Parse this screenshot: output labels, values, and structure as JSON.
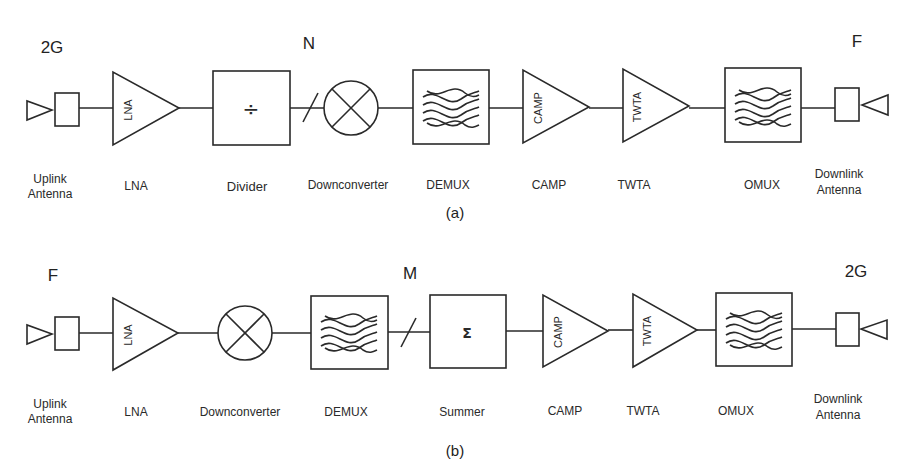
{
  "diagram_a": {
    "caption": "(a)",
    "markers": {
      "left": "2G",
      "middle": "N",
      "right": "F"
    },
    "labels": {
      "uplink_line1": "Uplink",
      "uplink_line2": "Antenna",
      "lna": "LNA",
      "divider": "Divider",
      "downconverter": "Downconverter",
      "demux": "DEMUX",
      "camp": "CAMP",
      "twta": "TWTA",
      "omux": "OMUX",
      "downlink_line1": "Downlink",
      "downlink_line2": "Antenna"
    },
    "inner": {
      "lna": "LNA",
      "divider": "÷",
      "camp": "CAMP",
      "twta": "TWTA"
    }
  },
  "diagram_b": {
    "caption": "(b)",
    "markers": {
      "left": "F",
      "middle": "M",
      "right": "2G"
    },
    "labels": {
      "uplink_line1": "Uplink",
      "uplink_line2": "Antenna",
      "lna": "LNA",
      "downconverter": "Downconverter",
      "demux": "DEMUX",
      "summer": "Summer",
      "camp": "CAMP",
      "twta": "TWTA",
      "omux": "OMUX",
      "downlink_line1": "Downlink",
      "downlink_line2": "Antenna"
    },
    "inner": {
      "lna": "LNA",
      "summer": "Σ",
      "camp": "CAMP",
      "twta": "TWTA"
    }
  }
}
